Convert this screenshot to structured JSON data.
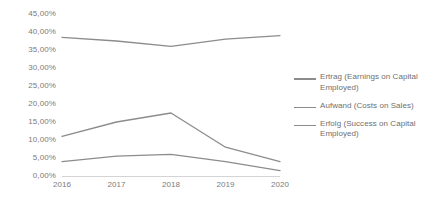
{
  "chart_data": {
    "type": "line",
    "title": "",
    "subtitle": "",
    "xlabel": "",
    "ylabel": "",
    "categories": [
      "2016",
      "2017",
      "2018",
      "2019",
      "2020"
    ],
    "ylim": [
      0,
      45
    ],
    "ytick_step": 5,
    "ytick_labels": [
      "45,00%",
      "40,00%",
      "35,00%",
      "30,00%",
      "25,00%",
      "20,00%",
      "15,00%",
      "10,00%",
      "5,00%",
      "0,00%"
    ],
    "ytick_values": [
      45,
      40,
      35,
      30,
      25,
      20,
      15,
      10,
      5,
      0
    ],
    "grid": false,
    "legend_position": "right",
    "series": [
      {
        "name": "Ertrag (Earnings on Capital Employed)",
        "color": "#8c8c8c",
        "values": [
          38.5,
          37.5,
          36.0,
          38.0,
          39.0
        ]
      },
      {
        "name": "Aufwand (Costs on Sales)",
        "color": "#8c8c8c",
        "values": [
          11.0,
          15.0,
          17.5,
          8.0,
          4.0
        ]
      },
      {
        "name": "Erfolg (Success on Capital Employed)",
        "color": "#8c8c8c",
        "values": [
          4.0,
          5.5,
          6.0,
          4.0,
          1.5
        ]
      }
    ]
  },
  "axis_text_color": "#7b7b7b",
  "legend_text_color": "#6f6f6f"
}
